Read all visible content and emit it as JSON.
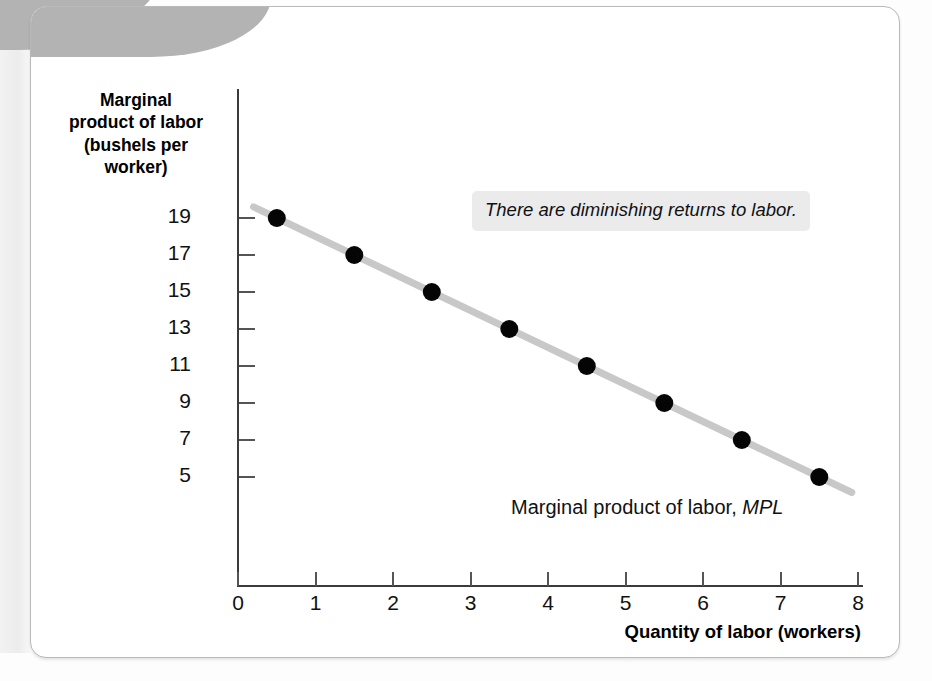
{
  "figure": {
    "y_axis_title": "Marginal product of labor (bushels per worker)",
    "y_axis_title_lines": [
      "Marginal",
      "product of labor",
      "(bushels per",
      "worker)"
    ],
    "x_axis_title": "Quantity of labor (workers)",
    "annotation": "There are diminishing returns to labor.",
    "series_label_text": "Marginal product of labor, ",
    "series_label_symbol": "MPL",
    "colors": {
      "line": "#c8c8c8",
      "marker": "#050505",
      "axis": "#3b3b3b",
      "annotation_bg": "#ebebeb",
      "corner_shape": "#b3b3b3",
      "panel_border": "#b9b9b9"
    }
  },
  "chart_data": {
    "type": "line",
    "title": "",
    "subtitle": "",
    "xlabel": "Quantity of labor (workers)",
    "ylabel": "Marginal product of labor (bushels per worker)",
    "x": [
      0.5,
      1.5,
      2.5,
      3.5,
      4.5,
      5.5,
      6.5,
      7.5
    ],
    "values": [
      19,
      17,
      15,
      13,
      11,
      9,
      7,
      5
    ],
    "series": [
      {
        "name": "Marginal product of labor, MPL",
        "x": [
          0.5,
          1.5,
          2.5,
          3.5,
          4.5,
          5.5,
          6.5,
          7.5
        ],
        "values": [
          19,
          17,
          15,
          13,
          11,
          9,
          7,
          5
        ],
        "marker": "filled-circle",
        "line_color": "#c8c8c8"
      }
    ],
    "xlim": [
      0,
      8
    ],
    "ylim": [
      0,
      20
    ],
    "xticks": [
      0,
      1,
      2,
      3,
      4,
      5,
      6,
      7,
      8
    ],
    "xtick_labels": [
      "0",
      "1",
      "2",
      "3",
      "4",
      "5",
      "6",
      "7",
      "8"
    ],
    "yticks": [
      5,
      7,
      9,
      11,
      13,
      15,
      17,
      19
    ],
    "ytick_labels": [
      "19",
      "17",
      "15",
      "13",
      "11",
      "9",
      "7",
      "5"
    ],
    "grid": false,
    "legend_position": "inline-right",
    "annotations": [
      {
        "text": "There are diminishing returns to labor.",
        "x": 3.7,
        "y": 19.2,
        "style": "italic-gray-box"
      },
      {
        "text": "Marginal product of labor, MPL",
        "x": 4.2,
        "y": 5.8,
        "style": "series-label"
      }
    ]
  }
}
